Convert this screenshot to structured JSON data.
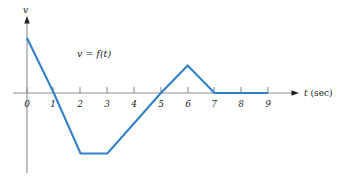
{
  "figure": {
    "name": "velocity-time-graph",
    "curve_label": "v = f(t)",
    "y_axis_label": "v",
    "x_axis_var": "t",
    "x_axis_unit": "(sec)",
    "line_color": "#3182c4",
    "axis_color": "#808285",
    "text_color": "#231f20"
  },
  "chart_data": {
    "type": "line",
    "title": "",
    "subtitle": "",
    "xlabel": "t (sec)",
    "ylabel": "v",
    "series_name": "v = f(t)",
    "grid": false,
    "legend": "none",
    "xlim": [
      0,
      9
    ],
    "ylim": [
      -2.2,
      2.0
    ],
    "x_ticks": [
      0,
      1,
      2,
      3,
      4,
      5,
      6,
      7,
      8,
      9
    ],
    "x_tick_labels": [
      "0",
      "1",
      "2",
      "3",
      "4",
      "5",
      "6",
      "7",
      "8",
      "9"
    ],
    "y_ticks": [],
    "y_tick_labels": [],
    "x": [
      0,
      1,
      2,
      3,
      5,
      6,
      7,
      9
    ],
    "y": [
      2.0,
      0,
      -2.2,
      -2.2,
      0,
      1.0,
      0,
      0
    ],
    "points": [
      {
        "t": 0,
        "v": 2.0
      },
      {
        "t": 1,
        "v": 0
      },
      {
        "t": 2,
        "v": -2.2
      },
      {
        "t": 3,
        "v": -2.2
      },
      {
        "t": 5,
        "v": 0
      },
      {
        "t": 6,
        "v": 1.0
      },
      {
        "t": 7,
        "v": 0
      },
      {
        "t": 9,
        "v": 0
      }
    ],
    "annotations": [
      {
        "text": "v = f(t)",
        "t": 2.6,
        "v": 1.45
      }
    ]
  }
}
